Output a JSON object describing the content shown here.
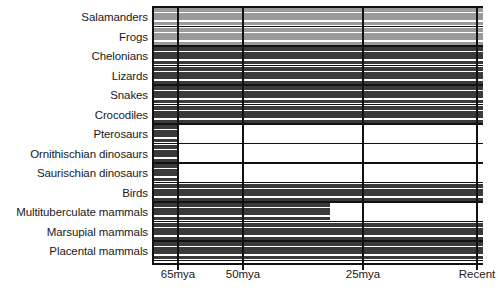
{
  "chart_data": {
    "type": "bar",
    "title": "",
    "subtitle": "",
    "xlabel": "",
    "ylabel": "",
    "orientation": "horizontal",
    "grid": true,
    "legend": "none",
    "xlim": [
      66,
      -2
    ],
    "x_axis": {
      "unit": "millions of years ago",
      "ticks": [
        {
          "label": "65mya",
          "value": 65,
          "px": 178
        },
        {
          "label": "50mya",
          "value": 50,
          "px": 243
        },
        {
          "label": "25mya",
          "value": 25,
          "px": 363
        },
        {
          "label": "Recent",
          "value": 0,
          "px": 477
        }
      ]
    },
    "categories": [
      "Salamanders",
      "Frogs",
      "Chelonians",
      "Lizards",
      "Snakes",
      "Crocodiles",
      "Pterosaurs",
      "Ornithischian dinosaurs",
      "Saurischian dinosaurs",
      "Birds",
      "Multituberculate mammals",
      "Marsupial mammals",
      "Placental mammals"
    ],
    "series": [
      {
        "name": "Stratigraphic range",
        "bars": [
          {
            "category": "Salamanders",
            "start_mya": 66,
            "end_mya": 0,
            "color": "#9a9a9a",
            "extinct": false
          },
          {
            "category": "Frogs",
            "start_mya": 66,
            "end_mya": 0,
            "color": "#9a9a9a",
            "extinct": false
          },
          {
            "category": "Chelonians",
            "start_mya": 66,
            "end_mya": 0,
            "color": "#3a3a3a",
            "extinct": false
          },
          {
            "category": "Lizards",
            "start_mya": 66,
            "end_mya": 0,
            "color": "#3a3a3a",
            "extinct": false
          },
          {
            "category": "Snakes",
            "start_mya": 66,
            "end_mya": 0,
            "color": "#3a3a3a",
            "extinct": false
          },
          {
            "category": "Crocodiles",
            "start_mya": 66,
            "end_mya": 0,
            "color": "#3a3a3a",
            "extinct": false
          },
          {
            "category": "Pterosaurs",
            "start_mya": 66,
            "end_mya": 65,
            "color": "#3a3a3a",
            "extinct": true
          },
          {
            "category": "Ornithischian dinosaurs",
            "start_mya": 66,
            "end_mya": 65,
            "color": "#3a3a3a",
            "extinct": true
          },
          {
            "category": "Saurischian dinosaurs",
            "start_mya": 66,
            "end_mya": 65,
            "color": "#3a3a3a",
            "extinct": true
          },
          {
            "category": "Birds",
            "start_mya": 66,
            "end_mya": 0,
            "color": "#3a3a3a",
            "extinct": false
          },
          {
            "category": "Multituberculate mammals",
            "start_mya": 66,
            "end_mya": 32,
            "color": "#3a3a3a",
            "extinct": true
          },
          {
            "category": "Marsupial mammals",
            "start_mya": 66,
            "end_mya": 0,
            "color": "#3a3a3a",
            "extinct": false
          },
          {
            "category": "Placental mammals",
            "start_mya": 66,
            "end_mya": 0,
            "color": "#3a3a3a",
            "extinct": false
          }
        ]
      }
    ],
    "colors": {
      "light_taxon": "#9a9a9a",
      "dark_taxon": "#3a3a3a",
      "axis": "#111111",
      "background": "#ffffff",
      "text": "#1a1a1a"
    }
  }
}
